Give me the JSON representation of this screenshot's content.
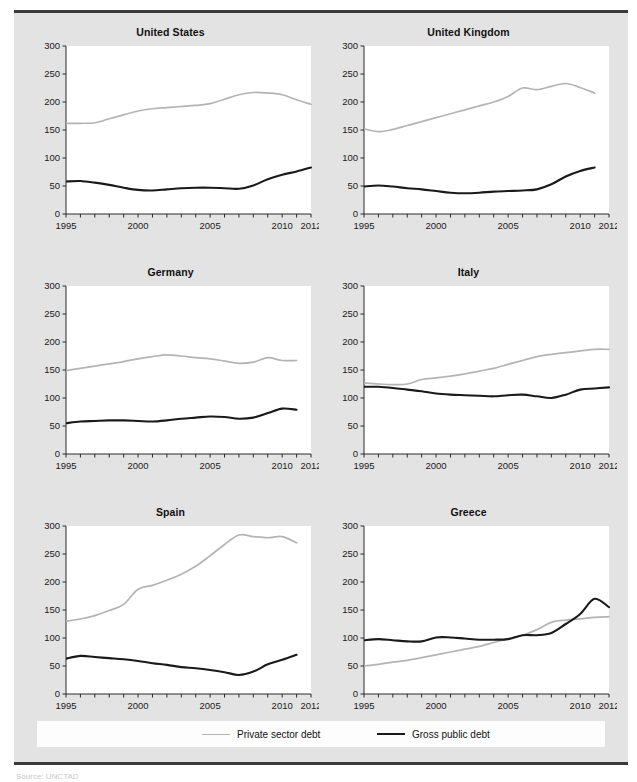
{
  "figure": {
    "background_color": "#e3e3e3",
    "plot_background_color": "#ffffff",
    "private_color": "#b4b4b4",
    "public_color": "#1a1a1a",
    "source_note": "Source:  UNCTAD"
  },
  "legend": {
    "items": [
      {
        "label": "Private sector debt",
        "color": "#b4b4b4"
      },
      {
        "label": "Gross public debt",
        "color": "#1a1a1a"
      }
    ]
  },
  "chart_data": [
    {
      "type": "line",
      "title": "United States",
      "xlabel": "",
      "ylabel": "",
      "xlim": [
        1995,
        2012
      ],
      "ylim": [
        0,
        300
      ],
      "yticks": [
        0,
        50,
        100,
        150,
        200,
        250,
        300
      ],
      "xticks": [
        1995,
        2000,
        2005,
        2010,
        2012
      ],
      "grid": false,
      "legend_position": "bottom-shared",
      "x": [
        1995,
        1996,
        1997,
        1998,
        1999,
        2000,
        2001,
        2002,
        2003,
        2004,
        2005,
        2006,
        2007,
        2008,
        2009,
        2010,
        2011,
        2012
      ],
      "series": [
        {
          "name": "Private sector debt",
          "color": "#b4b4b4",
          "values": [
            162,
            162,
            163,
            170,
            177,
            184,
            188,
            190,
            192,
            194,
            197,
            205,
            213,
            217,
            216,
            213,
            204,
            196
          ]
        },
        {
          "name": "Gross public debt",
          "color": "#1a1a1a",
          "values": [
            58,
            59,
            56,
            52,
            47,
            43,
            42,
            44,
            46,
            47,
            47,
            46,
            45,
            51,
            62,
            70,
            76,
            83
          ]
        }
      ]
    },
    {
      "type": "line",
      "title": "United Kingdom",
      "xlabel": "",
      "ylabel": "",
      "xlim": [
        1995,
        2012
      ],
      "ylim": [
        0,
        300
      ],
      "yticks": [
        0,
        50,
        100,
        150,
        200,
        250,
        300
      ],
      "xticks": [
        1995,
        2000,
        2005,
        2010,
        2012
      ],
      "grid": false,
      "legend_position": "bottom-shared",
      "x": [
        1995,
        1996,
        1997,
        1998,
        1999,
        2000,
        2001,
        2002,
        2003,
        2004,
        2005,
        2006,
        2007,
        2008,
        2009,
        2010,
        2011
      ],
      "series": [
        {
          "name": "Private sector debt",
          "color": "#b4b4b4",
          "values": [
            152,
            147,
            151,
            158,
            165,
            172,
            179,
            186,
            193,
            200,
            210,
            225,
            222,
            228,
            233,
            226,
            216
          ]
        },
        {
          "name": "Gross public debt",
          "color": "#1a1a1a",
          "values": [
            49,
            51,
            49,
            46,
            44,
            41,
            38,
            37,
            38,
            40,
            41,
            42,
            44,
            53,
            67,
            77,
            83,
            87
          ]
        }
      ]
    },
    {
      "type": "line",
      "title": "Germany",
      "xlabel": "",
      "ylabel": "",
      "xlim": [
        1995,
        2012
      ],
      "ylim": [
        0,
        300
      ],
      "yticks": [
        0,
        50,
        100,
        150,
        200,
        250,
        300
      ],
      "xticks": [
        1995,
        2000,
        2005,
        2010,
        2012
      ],
      "grid": false,
      "legend_position": "bottom-shared",
      "x": [
        1995,
        1996,
        1997,
        1998,
        1999,
        2000,
        2001,
        2002,
        2003,
        2004,
        2005,
        2006,
        2007,
        2008,
        2009,
        2010,
        2011
      ],
      "series": [
        {
          "name": "Private sector debt",
          "color": "#b4b4b4",
          "values": [
            149,
            153,
            157,
            161,
            165,
            170,
            174,
            177,
            175,
            172,
            170,
            166,
            162,
            164,
            172,
            167,
            167
          ]
        },
        {
          "name": "Gross public debt",
          "color": "#1a1a1a",
          "values": [
            55,
            58,
            59,
            60,
            60,
            59,
            58,
            60,
            63,
            65,
            67,
            66,
            63,
            65,
            73,
            81,
            79,
            79
          ]
        }
      ]
    },
    {
      "type": "line",
      "title": "Italy",
      "xlabel": "",
      "ylabel": "",
      "xlim": [
        1995,
        2012
      ],
      "ylim": [
        0,
        300
      ],
      "yticks": [
        0,
        50,
        100,
        150,
        200,
        250,
        300
      ],
      "xticks": [
        1995,
        2000,
        2005,
        2010,
        2012
      ],
      "grid": false,
      "legend_position": "bottom-shared",
      "x": [
        1995,
        1996,
        1997,
        1998,
        1999,
        2000,
        2001,
        2002,
        2003,
        2004,
        2005,
        2006,
        2007,
        2008,
        2009,
        2010,
        2011,
        2012
      ],
      "series": [
        {
          "name": "Private sector debt",
          "color": "#b4b4b4",
          "values": [
            127,
            125,
            124,
            125,
            133,
            136,
            139,
            143,
            148,
            153,
            160,
            167,
            174,
            178,
            181,
            184,
            187,
            187
          ]
        },
        {
          "name": "Gross public debt",
          "color": "#1a1a1a",
          "values": [
            120,
            120,
            118,
            115,
            112,
            108,
            106,
            105,
            104,
            103,
            105,
            106,
            103,
            100,
            106,
            115,
            117,
            119,
            124
          ]
        }
      ]
    },
    {
      "type": "line",
      "title": "Spain",
      "xlabel": "",
      "ylabel": "",
      "xlim": [
        1995,
        2012
      ],
      "ylim": [
        0,
        300
      ],
      "yticks": [
        0,
        50,
        100,
        150,
        200,
        250,
        300
      ],
      "xticks": [
        1995,
        2000,
        2005,
        2010,
        2012
      ],
      "grid": false,
      "legend_position": "bottom-shared",
      "x": [
        1995,
        1996,
        1997,
        1998,
        1999,
        2000,
        2001,
        2002,
        2003,
        2004,
        2005,
        2006,
        2007,
        2008,
        2009,
        2010,
        2011
      ],
      "series": [
        {
          "name": "Private sector debt",
          "color": "#b4b4b4",
          "values": [
            130,
            134,
            140,
            149,
            160,
            187,
            194,
            203,
            214,
            228,
            247,
            267,
            284,
            281,
            279,
            281,
            270
          ]
        },
        {
          "name": "Gross public debt",
          "color": "#1a1a1a",
          "values": [
            63,
            68,
            66,
            64,
            62,
            59,
            55,
            52,
            48,
            46,
            43,
            39,
            34,
            40,
            53,
            61,
            70,
            83
          ]
        }
      ]
    },
    {
      "type": "line",
      "title": "Greece",
      "xlabel": "",
      "ylabel": "",
      "xlim": [
        1995,
        2012
      ],
      "ylim": [
        0,
        300
      ],
      "yticks": [
        0,
        50,
        100,
        150,
        200,
        250,
        300
      ],
      "xticks": [
        1995,
        2000,
        2005,
        2010,
        2012
      ],
      "grid": false,
      "legend_position": "bottom-shared",
      "x": [
        1995,
        1996,
        1997,
        1998,
        1999,
        2000,
        2001,
        2002,
        2003,
        2004,
        2005,
        2006,
        2007,
        2008,
        2009,
        2010,
        2011,
        2012
      ],
      "series": [
        {
          "name": "Private sector debt",
          "color": "#b4b4b4",
          "values": [
            50,
            53,
            57,
            60,
            65,
            70,
            75,
            80,
            85,
            92,
            99,
            105,
            115,
            128,
            132,
            134,
            137,
            138
          ]
        },
        {
          "name": "Gross public debt",
          "color": "#1a1a1a",
          "values": [
            96,
            98,
            96,
            94,
            94,
            101,
            101,
            99,
            97,
            97,
            98,
            105,
            105,
            109,
            125,
            143,
            170,
            155
          ]
        }
      ]
    }
  ]
}
